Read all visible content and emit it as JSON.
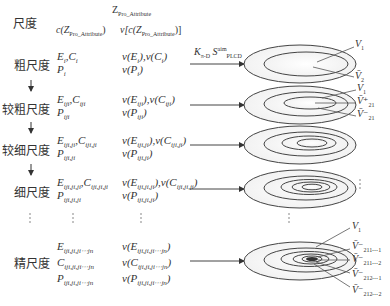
{
  "header": {
    "scale_col": "尺度",
    "z_attr": "Z",
    "z_attr_sub": "Pro_Attribute",
    "c_attr": "c(Z",
    "c_attr_sub": "Pro_Attribute",
    "c_attr_close": ")",
    "v_attr": "v[c(Z",
    "v_attr_sub": "Pro_Attribute",
    "v_attr_close": ")]"
  },
  "arrow_label": {
    "k": "K",
    "k_sub": "π-D",
    "s": "S",
    "s_sup": "aim",
    "s_sub": "PLCD"
  },
  "down_arrow": "↓",
  "ellipsis_v": "⋮",
  "rows": [
    {
      "scale": "粗尺度",
      "lines": [
        {
          "a": "E",
          "a_sub": "i",
          "b": ",C",
          "b_sub": "i",
          "v": "v(E",
          "v_sub": "i",
          "v2": "),v(C",
          "v2_sub": "i",
          "v_close": ")"
        },
        {
          "a": "P",
          "a_sub": "i",
          "v": "v(P",
          "v_sub": "i",
          "v_close": ")"
        }
      ],
      "labels": [
        {
          "t": "V",
          "s": "1"
        },
        {
          "t": "V̄",
          "s": "2"
        }
      ]
    },
    {
      "scale": "较粗尺度",
      "lines": [
        {
          "a": "E",
          "a_sub": "iji",
          "b": ",C",
          "b_sub": "iji",
          "v": "v(E",
          "v_sub": "iji",
          "v2": "),v(C",
          "v2_sub": "iji",
          "v_close": ")"
        },
        {
          "a": "P",
          "a_sub": "iji",
          "v": "v(P",
          "v_sub": "iji",
          "v_close": ")"
        }
      ],
      "labels": [
        {
          "t": "V",
          "s": "1"
        },
        {
          "t": "V̄⁺",
          "s": "21"
        },
        {
          "t": "V̄⁻",
          "s": "21"
        }
      ]
    },
    {
      "scale": "较细尺度",
      "lines": [
        {
          "a": "E",
          "a_sub": "iji,ji",
          "b": ",C",
          "b_sub": "iji,ji",
          "v": "v(E",
          "v_sub": "iji,ji",
          "v2": "),v(C",
          "v2_sub": "iji,ji",
          "v_close": ")"
        },
        {
          "a": "P",
          "a_sub": "iji,ji",
          "v": "v(P",
          "v_sub": "iji,ji",
          "v_close": ")"
        }
      ],
      "labels": []
    },
    {
      "scale": "细尺度",
      "lines": [
        {
          "a": "E",
          "a_sub": "iji,ji,ji",
          "b": ",C",
          "b_sub": "iji,ji,ji",
          "v": "v(E",
          "v_sub": "iji,ji,ji",
          "v2": "),v(C",
          "v2_sub": "iji,ji,ji",
          "v_close": ")"
        },
        {
          "a": "P",
          "a_sub": "iji,ji,ji",
          "v": "v(P",
          "v_sub": "iji,ji,ji",
          "v_close": ")"
        }
      ],
      "labels": []
    },
    {
      "scale": "精尺度",
      "lines": [
        {
          "a": "E",
          "a_sub": "iji,ji,ji⋯jn",
          "v": "v(E",
          "v_sub": "iji,ji,ji⋯jn",
          "v_close": ")"
        },
        {
          "a": "C",
          "a_sub": "iji,ji,ji⋯jn",
          "v": "v(C",
          "v_sub": "iji,ji,ji⋯jn",
          "v_close": ")"
        },
        {
          "a": "P",
          "a_sub": "iji,ji,ji⋯jn",
          "v": "v(P",
          "v_sub": "iji,ji,ji⋯jn",
          "v_close": ")"
        }
      ],
      "labels": [
        {
          "t": "V",
          "s": "1"
        },
        {
          "t": "V̄⁻",
          "s": "211⋯1"
        },
        {
          "t": "V̄⁻",
          "s": "211⋯2"
        },
        {
          "t": "V̄⁻",
          "s": "212⋯1"
        },
        {
          "t": "V̄⁻",
          "s": "212⋯2"
        }
      ]
    }
  ]
}
